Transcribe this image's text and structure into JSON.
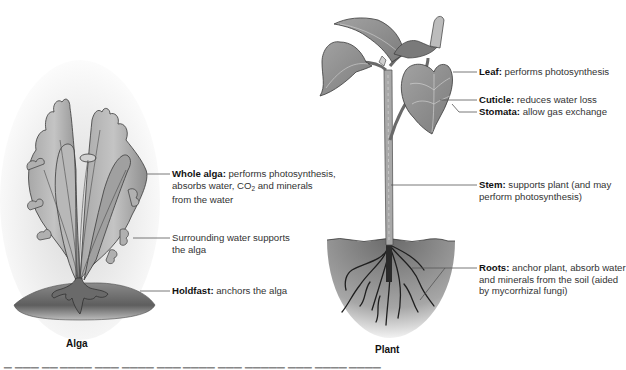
{
  "figure": {
    "left_panel": {
      "title": "Alga",
      "labels": [
        {
          "id": "whole-alga",
          "term": "Whole alga:",
          "lines": [
            "performs photosynthesis,",
            "absorbs water, CO",
            "2",
            " and minerals",
            "from the water"
          ]
        },
        {
          "id": "surrounding-water",
          "term": "",
          "lines": [
            "Surrounding water supports",
            "the alga"
          ]
        },
        {
          "id": "holdfast",
          "term": "Holdfast:",
          "lines": [
            "anchors the alga"
          ]
        }
      ]
    },
    "right_panel": {
      "title": "Plant",
      "labels": [
        {
          "id": "leaf",
          "term": "Leaf:",
          "lines": [
            "performs photosynthesis"
          ]
        },
        {
          "id": "cuticle",
          "term": "Cuticle:",
          "lines": [
            "reduces water loss"
          ]
        },
        {
          "id": "stomata",
          "term": "Stomata:",
          "lines": [
            "allow gas exchange"
          ]
        },
        {
          "id": "stem",
          "term": "Stem:",
          "lines": [
            "supports plant (and may",
            "perform photosynthesis)"
          ]
        },
        {
          "id": "roots",
          "term": "Roots:",
          "lines": [
            "anchor plant, absorb water",
            "and minerals from the soil (aided",
            "by mycorrhizal fungi)"
          ]
        }
      ]
    },
    "colors": {
      "alga_fill": "#9a9a9a",
      "alga_outline": "#3a3a3a",
      "leaf_fill": "#8e8e8e",
      "soil_dark": "#6e6e6e",
      "leader_line": "#555555",
      "text": "#333333"
    },
    "caption_cutoff": "(caption text cut off at image bottom — illegible)"
  }
}
